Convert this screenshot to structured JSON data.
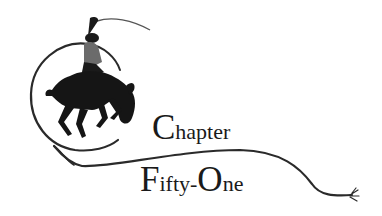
{
  "heading": {
    "line1": {
      "initial": "C",
      "rest": "hapter"
    },
    "line2": {
      "initial1": "F",
      "rest1": "ifty-",
      "initial2": "O",
      "rest2": "ne"
    }
  },
  "illustration": {
    "subject": "bronco-rider-with-lasso-icon",
    "ink_color": "#1a1a1a"
  }
}
